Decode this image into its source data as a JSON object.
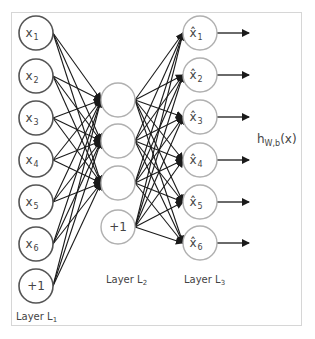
{
  "diagram": {
    "type": "autoencoder-neural-network",
    "layers": [
      {
        "name": "Layer L1",
        "label": "Layer L",
        "subscript": "1",
        "nodes": [
          {
            "text": "x",
            "sub": "1"
          },
          {
            "text": "x",
            "sub": "2"
          },
          {
            "text": "x",
            "sub": "3"
          },
          {
            "text": "x",
            "sub": "4"
          },
          {
            "text": "x",
            "sub": "5"
          },
          {
            "text": "x",
            "sub": "6"
          },
          {
            "text": "+1",
            "sub": ""
          }
        ],
        "node_stroke": "#555555"
      },
      {
        "name": "Layer L2",
        "label": "Layer L",
        "subscript": "2",
        "nodes": [
          {
            "text": "",
            "sub": ""
          },
          {
            "text": "",
            "sub": ""
          },
          {
            "text": "",
            "sub": ""
          },
          {
            "text": "+1",
            "sub": ""
          }
        ],
        "node_stroke": "#b0b0b0"
      },
      {
        "name": "Layer L3",
        "label": "Layer L",
        "subscript": "3",
        "nodes": [
          {
            "text": "x̂",
            "sub": "1"
          },
          {
            "text": "x̂",
            "sub": "2"
          },
          {
            "text": "x̂",
            "sub": "3"
          },
          {
            "text": "x̂",
            "sub": "4"
          },
          {
            "text": "x̂",
            "sub": "5"
          },
          {
            "text": "x̂",
            "sub": "6"
          }
        ],
        "node_stroke": "#b0b0b0"
      }
    ],
    "output_label": {
      "main": "h",
      "sub": "W,b",
      "arg": "(x)"
    },
    "edges": "fully-connected L1→L2 (excluding L2 bias), L2→L3; arrows out of each L3 node",
    "colors": {
      "edge": "#1a1a1a",
      "frame": "#d6d6d6",
      "text": "#444444"
    }
  }
}
